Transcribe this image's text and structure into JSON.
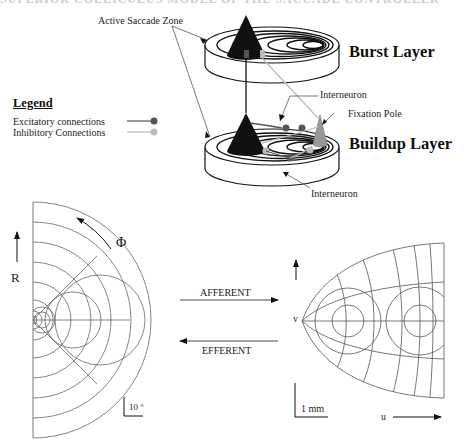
{
  "top_diagram": {
    "cut_title": "SUPERIOR COLLICULUS MODEL OF THE SACCADE CONTROLLER",
    "labels": {
      "active_saccade_zone": "Active Saccade Zone",
      "burst_layer": "Burst Layer",
      "buildup_layer": "Buildup Layer",
      "interneuron_upper": "Interneuron",
      "interneuron_lower": "Interneuron",
      "fixation_pole": "Fixation Pole"
    },
    "legend": {
      "title": "Legend",
      "items": [
        {
          "label": "Excitatory connections",
          "color": "#555555"
        },
        {
          "label": "Inhibitory Connections",
          "color": "#bbbbbb"
        }
      ]
    },
    "colors": {
      "saccade_cone": "#111111",
      "fixation_cone": "#999999",
      "excitatory": "#555555",
      "inhibitory": "#bbbbbb"
    }
  },
  "bottom_diagram": {
    "left_panel": {
      "axis_r": "R",
      "axis_phi": "Φ",
      "scale_bar": "10 °"
    },
    "middle": {
      "afferent": "AFFERENT",
      "efferent": "EFFERENT"
    },
    "right_panel": {
      "axis_v": "v",
      "axis_u": "u",
      "scale_bar": "1 mm"
    }
  }
}
